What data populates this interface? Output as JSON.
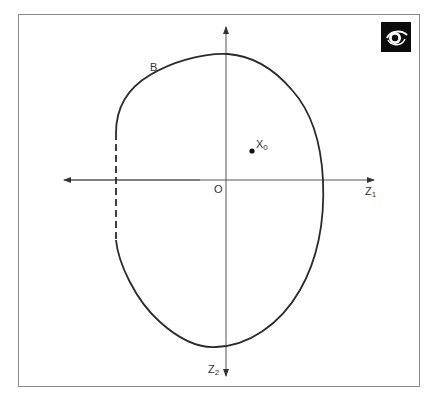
{
  "diagram": {
    "title": "",
    "curve_label": "B",
    "origin_label": "O",
    "point": {
      "label": "X",
      "subscript": "0"
    },
    "axes": {
      "horizontal": {
        "label": "Z",
        "subscript": "1"
      },
      "vertical": {
        "label": "Z",
        "subscript": "2"
      }
    },
    "logo": "eye-icon",
    "colors": {
      "stroke": "#2a2a2a",
      "axis": "#555555",
      "frame": "#8a8a8a",
      "logo_bg": "#0b0b0b"
    }
  }
}
